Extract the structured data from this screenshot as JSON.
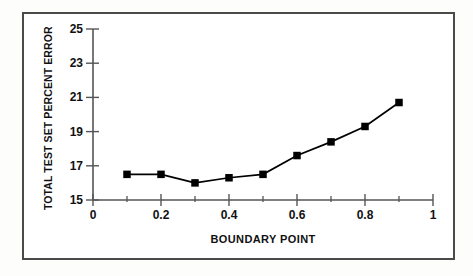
{
  "chart_data": {
    "type": "line",
    "title": "",
    "subtitle": "",
    "xlabel": "BOUNDARY POINT",
    "ylabel": "TOTAL TEST SET PERCENT ERROR",
    "x": [
      0.1,
      0.2,
      0.3,
      0.4,
      0.5,
      0.6,
      0.7,
      0.8,
      0.9
    ],
    "values": [
      16.5,
      16.5,
      16.0,
      16.3,
      16.5,
      17.6,
      18.4,
      19.3,
      20.7
    ],
    "series": [
      {
        "name": "total test set percent error",
        "values": [
          16.5,
          16.5,
          16.0,
          16.3,
          16.5,
          17.6,
          18.4,
          19.3,
          20.7
        ]
      }
    ],
    "xlim": [
      0,
      1
    ],
    "ylim": [
      15,
      25
    ],
    "xticks": [
      0,
      0.2,
      0.4,
      0.6,
      0.8,
      1
    ],
    "xtick_labels": [
      "0",
      "0.2",
      "0.4",
      "0.6",
      "0.8",
      "1"
    ],
    "x_minor_ticks": [
      0.1,
      0.3,
      0.5,
      0.7,
      0.9
    ],
    "yticks": [
      15,
      17,
      19,
      21,
      23,
      25
    ],
    "ytick_labels": [
      "15",
      "17",
      "19",
      "21",
      "23",
      "25"
    ],
    "grid": false,
    "legend": false,
    "legend_position": "none",
    "marker": "square",
    "line_color": "#000000",
    "marker_color": "#000000",
    "axis_color": "#555555",
    "frame_color": "#4a4a4a",
    "background_color": "#ffffff"
  },
  "axes": {
    "y_title": "TOTAL TEST SET PERCENT ERROR",
    "x_title": "BOUNDARY POINT",
    "y_labels": [
      "25",
      "23",
      "21",
      "19",
      "17",
      "15"
    ],
    "x_labels": [
      "0",
      "0.2",
      "0.4",
      "0.6",
      "0.8",
      "1"
    ]
  }
}
